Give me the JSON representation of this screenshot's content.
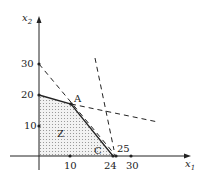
{
  "diagram": {
    "type": "linear-programming-feasible-region",
    "axes": {
      "x_label": "x",
      "x_sub": "1",
      "y_label": "x",
      "y_sub": "2",
      "x_ticks": [
        "10",
        "24",
        "30"
      ],
      "x_extra_label": "25",
      "y_ticks": [
        "10",
        "20",
        "30"
      ]
    },
    "points": {
      "A": "A",
      "C": "C"
    },
    "region_label": "Z",
    "colors": {
      "axis": "#222222",
      "region_fill": "#d9d9d9",
      "line": "#222222"
    }
  }
}
